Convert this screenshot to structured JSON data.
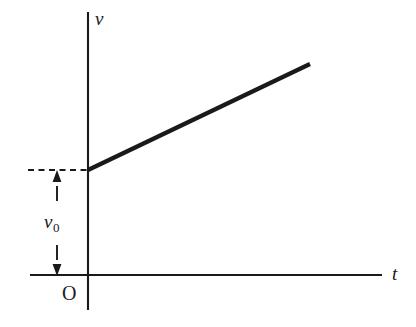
{
  "figure": {
    "type": "velocity-time-graph",
    "background_color": "#ffffff",
    "ink_color": "#1a1a1a",
    "width": 416,
    "height": 327
  },
  "labels": {
    "y_axis": "v",
    "x_axis": "t",
    "origin": "O",
    "initial_velocity_symbol": "v",
    "initial_velocity_subscript": "0"
  },
  "chart_data": {
    "type": "line",
    "title": "",
    "xlabel": "t",
    "ylabel": "v",
    "grid": false,
    "legend": false,
    "axes": {
      "x_axis": {
        "label": "t",
        "ticks": [],
        "origin_marked": true,
        "origin_label": "O",
        "pixel_y": 275,
        "pixel_x_start": 30,
        "pixel_x_end": 382,
        "arrowhead": false
      },
      "y_axis": {
        "label": "v",
        "ticks": [],
        "pixel_x": 88,
        "pixel_y_start": 12,
        "pixel_y_end": 310,
        "arrowhead": false
      }
    },
    "series": [
      {
        "name": "v(t) = v0 + a t",
        "style": "solid-thick",
        "color": "#1a1a1a",
        "points": [
          {
            "x": 0,
            "y": 1,
            "px": 88,
            "py": 170
          },
          {
            "x": 1,
            "y": 2.05,
            "px": 310,
            "py": 64
          }
        ],
        "intercept_value": "v0",
        "slope_sign": "positive"
      }
    ],
    "annotations": [
      {
        "kind": "dashed-guide",
        "name": "v0-level-dashed-line",
        "orientation": "horizontal",
        "from_px": [
          28,
          170
        ],
        "to_px": [
          88,
          170
        ]
      },
      {
        "kind": "dimension-arrow",
        "name": "v0-measure-up-arrow",
        "direction": "up",
        "from_px": [
          57,
          200
        ],
        "to_px": [
          57,
          172
        ]
      },
      {
        "kind": "dimension-arrow",
        "name": "v0-measure-down-arrow",
        "direction": "down",
        "from_px": [
          57,
          246
        ],
        "to_px": [
          57,
          274
        ]
      },
      {
        "kind": "text",
        "name": "v0-label",
        "text": "v0",
        "at_px": [
          48,
          225
        ]
      }
    ]
  }
}
